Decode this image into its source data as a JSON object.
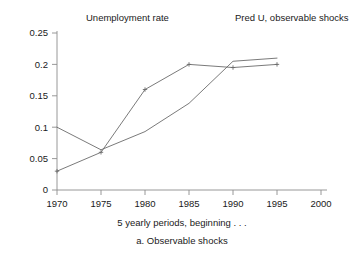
{
  "chart_data": {
    "type": "line",
    "title": "",
    "subtitle": "a. Observable shocks",
    "xlabel": "5 yearly periods, beginning . . .",
    "ylabel": "",
    "x": [
      1970,
      1975,
      1980,
      1985,
      1990,
      1995
    ],
    "xlim": [
      1968,
      2001
    ],
    "ylim": [
      0,
      0.25
    ],
    "xticks": [
      1970,
      1975,
      1980,
      1985,
      1990,
      1995,
      2000
    ],
    "xtick_labels": [
      "1970",
      "1975",
      "1980",
      "1985",
      "1990",
      "1995",
      "2000"
    ],
    "yticks": [
      0,
      0.05,
      0.1,
      0.15,
      0.2,
      0.25
    ],
    "ytick_labels": [
      "0",
      "0.05",
      "0.1",
      "0.15",
      "0.2",
      "0.25"
    ],
    "grid": false,
    "legend_position": "top",
    "series": [
      {
        "name": "Unemployment rate",
        "values": [
          0.03,
          0.06,
          0.16,
          0.2,
          0.195,
          0.2
        ],
        "markers": true,
        "color": "#6b6b6b"
      },
      {
        "name": "Pred U, observable shocks",
        "values": [
          0.1,
          0.064,
          0.093,
          0.138,
          0.205,
          0.21
        ],
        "markers": false,
        "color": "#6b6b6b"
      }
    ]
  },
  "legend": {
    "items": [
      {
        "label": "Unemployment rate"
      },
      {
        "label": "Pred U, observable shocks"
      }
    ]
  },
  "axes": {
    "x_title": "5 yearly periods, beginning . . .",
    "caption": "a. Observable shocks",
    "y_tick_0": "0",
    "y_tick_1": "0.05",
    "y_tick_2": "0.1",
    "y_tick_3": "0.15",
    "y_tick_4": "0.2",
    "y_tick_5": "0.25",
    "x_tick_0": "1970",
    "x_tick_1": "1975",
    "x_tick_2": "1980",
    "x_tick_3": "1985",
    "x_tick_4": "1990",
    "x_tick_5": "1995",
    "x_tick_6": "2000"
  },
  "colors": {
    "line": "#6b6b6b",
    "axis": "#8d8d8d",
    "text": "#1a1a1a",
    "background": "#ffffff"
  }
}
